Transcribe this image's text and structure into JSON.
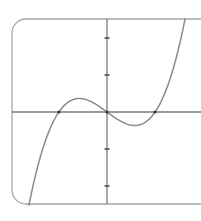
{
  "chart_data": {
    "type": "line",
    "title": "",
    "xlabel": "",
    "ylabel": "",
    "function": "y = k * x * (x - r) * (x + r)",
    "roots": [
      -1.3,
      0,
      1.3
    ],
    "local_max": {
      "x": -0.75,
      "y": 0.36
    },
    "local_min": {
      "x": 0.75,
      "y": -0.36
    },
    "xlim": [
      -2.57,
      2.55
    ],
    "ylim": [
      -2.5,
      2.52
    ],
    "y_ticks": [
      -2,
      -1,
      1,
      2
    ],
    "x_ticks": [],
    "tick_labels_shown": false,
    "grid": false,
    "legend": null,
    "marked_points": [
      {
        "x": -1.3,
        "y": 0
      },
      {
        "x": 0,
        "y": 0
      },
      {
        "x": 1.3,
        "y": 0
      }
    ],
    "series": [
      {
        "name": "cubic",
        "x": [
          -2.11,
          -1.8,
          -1.5,
          -1.3,
          -1.0,
          -0.75,
          -0.5,
          0,
          0.5,
          0.75,
          1.0,
          1.3,
          1.5,
          1.8,
          2.11
        ],
        "y": [
          -2.52,
          -1.28,
          -0.5,
          0,
          0.29,
          0.36,
          0.25,
          0,
          -0.25,
          -0.36,
          -0.29,
          0,
          0.5,
          1.28,
          2.52
        ]
      }
    ]
  },
  "style": {
    "frame_color": "#a8a8a8",
    "axis_color": "#7a7a7a",
    "curve_color": "#8a8a8a",
    "point_color": "#3a3a3a",
    "background": "#ffffff"
  },
  "geometry": {
    "origin_px": [
      107,
      112
    ],
    "unit_px": 37,
    "frame": {
      "left": 12,
      "top": 19,
      "right": 215,
      "bottom": 204,
      "radius": 14
    }
  }
}
